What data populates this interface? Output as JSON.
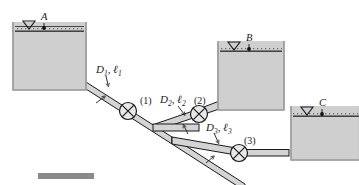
{
  "figure": {
    "type": "three-reservoir-pipe-network",
    "background_color": "#ffffff",
    "line_color": "#1a1a1a",
    "tank_fill_color": "#cfcfcf",
    "tank_wall_color": "#c4c4c4",
    "pipe_fill_color": "#d4d4d4",
    "water_surface_color": "#4a4a4a",
    "accent_bar_color": "#8a8a8a"
  },
  "reservoirs": [
    {
      "id": "A",
      "label": "A",
      "surface_symbol": "▽",
      "description": "upper-left reservoir, highest free surface"
    },
    {
      "id": "B",
      "label": "B",
      "surface_symbol": "▽",
      "description": "middle-right reservoir, intermediate free surface"
    },
    {
      "id": "C",
      "label": "C",
      "surface_symbol": "▽",
      "description": "far-right reservoir, lowest free surface"
    }
  ],
  "pipes": [
    {
      "id": "pipe-1",
      "diameter_symbol": "D",
      "diameter_subscript": "1",
      "length_symbol": "ℓ",
      "length_subscript": "1",
      "separator": ", ",
      "description": "pipe from reservoir A down to the junction"
    },
    {
      "id": "pipe-2",
      "diameter_symbol": "D",
      "diameter_subscript": "2",
      "length_symbol": "ℓ",
      "length_subscript": "2",
      "separator": ", ",
      "description": "branch pipe from junction to reservoir B"
    },
    {
      "id": "pipe-3",
      "diameter_symbol": "D",
      "diameter_subscript": "3",
      "length_symbol": "ℓ",
      "length_subscript": "3",
      "separator": ", ",
      "description": "pipe from junction down to reservoir C"
    }
  ],
  "valves": [
    {
      "id": "valve-1",
      "label": "(1)",
      "glyph": "circle-with-x",
      "on_pipe": "pipe-1"
    },
    {
      "id": "valve-2",
      "label": "(2)",
      "glyph": "circle-with-x",
      "on_pipe": "pipe-2"
    },
    {
      "id": "valve-3",
      "label": "(3)",
      "glyph": "circle-with-x",
      "on_pipe": "pipe-3"
    }
  ]
}
